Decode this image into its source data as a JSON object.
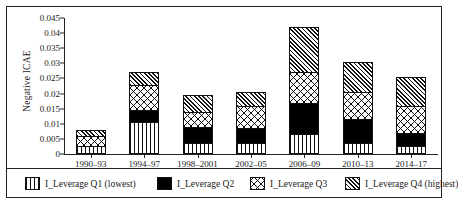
{
  "chart_data": {
    "type": "bar",
    "subtype": "stacked-bar",
    "title": "",
    "xlabel": "",
    "ylabel": "Negative ICAE",
    "ylim": [
      0,
      0.045
    ],
    "ytick_labels": [
      "0.045",
      "0.04",
      "0.035",
      "0.03",
      "0.025",
      "0.02",
      "0.015",
      "0.01",
      "0.005",
      "0"
    ],
    "ytick_values": [
      0.045,
      0.04,
      0.035,
      0.03,
      0.025,
      0.02,
      0.015,
      0.01,
      0.005,
      0
    ],
    "grid": false,
    "legend_position": "bottom",
    "categories": [
      "1990–93",
      "1994–97",
      "1998–2001",
      "2002–05",
      "2006–09",
      "2010–13",
      "2014–17"
    ],
    "series": [
      {
        "name": "I_Leverage Q1 (lowest)",
        "pattern": "vertical-stripes",
        "values": [
          0.0025,
          0.0105,
          0.0035,
          0.0035,
          0.0065,
          0.0035,
          0.0025
        ]
      },
      {
        "name": "I_Leverage Q2",
        "pattern": "solid-black",
        "values": [
          0.0,
          0.004,
          0.0055,
          0.005,
          0.0105,
          0.008,
          0.0045
        ]
      },
      {
        "name": "I_Leverage Q3",
        "pattern": "crosshatch",
        "values": [
          0.0035,
          0.0085,
          0.005,
          0.0075,
          0.01,
          0.009,
          0.009
        ]
      },
      {
        "name": "I_Leverage Q4 (highest)",
        "pattern": "diagonal-hatch",
        "values": [
          0.002,
          0.004,
          0.0055,
          0.0045,
          0.015,
          0.01,
          0.0095
        ]
      }
    ],
    "totals": [
      0.008,
      0.027,
      0.0195,
      0.0205,
      0.042,
      0.0305,
      0.0255
    ]
  }
}
